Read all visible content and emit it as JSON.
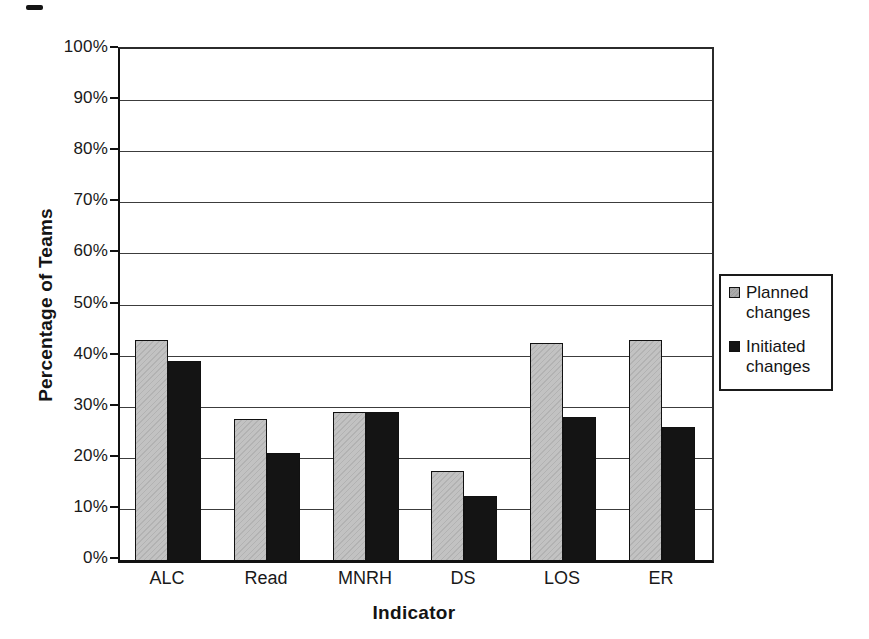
{
  "figure": {
    "background_color": "#ffffff",
    "artifact_note": "small black scan mark, top-left"
  },
  "chart_data": {
    "type": "bar",
    "title": "",
    "xlabel": "Indicator",
    "ylabel": "Percentage of Teams",
    "categories": [
      "ALC",
      "Read",
      "MNRH",
      "DS",
      "LOS",
      "ER"
    ],
    "series": [
      {
        "name": "Planned changes",
        "color": "#c2c2c2",
        "values": [
          43,
          27.5,
          29,
          17.5,
          42.5,
          43
        ]
      },
      {
        "name": "Initiated changes",
        "color": "#141414",
        "values": [
          39,
          21,
          29,
          12.5,
          28,
          26
        ]
      }
    ],
    "ylim": [
      0,
      100
    ],
    "ytick_step": 10,
    "ytick_suffix": "%",
    "grid": true,
    "legend_position": "right"
  },
  "legend": {
    "items": [
      {
        "label": "Planned changes",
        "swatch_color": "#ababab",
        "series_key": "planned"
      },
      {
        "label": "Initiated changes",
        "swatch_color": "#141414",
        "series_key": "initiated"
      }
    ]
  }
}
